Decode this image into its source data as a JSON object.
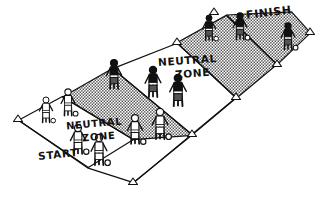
{
  "diagram": {
    "style": "hand-drawn line art, halftone shading",
    "background_color": "#ffffff",
    "ink_color": "#111111",
    "zone_fill_color": "#b9b9b9"
  },
  "labels": {
    "finish": "FINISH",
    "neutral_zone_far_line1": "NEUTRAL",
    "neutral_zone_far_line2": "ZONE",
    "neutral_zone_near_line1": "NEUTRAL",
    "neutral_zone_near_line2": "ZONE",
    "start": "START"
  },
  "zones": [
    {
      "name": "start-zone",
      "label": "START",
      "shaded": false,
      "polygon": "18,120 62,97 133,140 88,168"
    },
    {
      "name": "neutral-zone-near",
      "label": "NEUTRAL ZONE",
      "shaded": true,
      "polygon": "62,97 113,69 192,135 133,140"
    },
    {
      "name": "middle-open-zone",
      "label": "",
      "shaded": false,
      "polygon": "113,69 177,43 236,98 192,135"
    },
    {
      "name": "neutral-zone-far",
      "label": "NEUTRAL ZONE",
      "shaded": true,
      "polygon": "177,43 226,15 277,65 236,98"
    },
    {
      "name": "finish-zone",
      "label": "FINISH",
      "shaded": true,
      "polygon": "226,15 292,12 310,33 277,65"
    }
  ],
  "cone_markers": [
    {
      "name": "cone-start-left",
      "x": 18,
      "y": 120
    },
    {
      "name": "cone-start-bottom",
      "x": 133,
      "y": 183
    },
    {
      "name": "cone-near-nz-right",
      "x": 192,
      "y": 135
    },
    {
      "name": "cone-mid-right",
      "x": 236,
      "y": 98
    },
    {
      "name": "cone-far-nz-right",
      "x": 277,
      "y": 65
    },
    {
      "name": "cone-far-nz-left",
      "x": 177,
      "y": 43
    },
    {
      "name": "cone-finish-top",
      "x": 214,
      "y": 13
    },
    {
      "name": "cone-finish-right",
      "x": 310,
      "y": 33
    }
  ],
  "players": [
    {
      "name": "player-finish-1",
      "shirt": "dark",
      "x": 209,
      "y": 18,
      "scale": 1.0,
      "ball": true
    },
    {
      "name": "player-finish-2",
      "shirt": "dark",
      "x": 240,
      "y": 16,
      "scale": 1.05,
      "ball": true
    },
    {
      "name": "player-finish-3",
      "shirt": "dark",
      "x": 288,
      "y": 26,
      "scale": 1.05,
      "ball": true
    },
    {
      "name": "player-nz-far-1",
      "shirt": "dark",
      "x": 114,
      "y": 63,
      "scale": 1.15,
      "ball": false
    },
    {
      "name": "player-nz-far-2",
      "shirt": "dark",
      "x": 153,
      "y": 70,
      "scale": 1.2,
      "ball": false
    },
    {
      "name": "player-nz-far-3",
      "shirt": "dark",
      "x": 178,
      "y": 78,
      "scale": 1.25,
      "ball": false
    },
    {
      "name": "player-open-1",
      "shirt": "light",
      "x": 135,
      "y": 118,
      "scale": 1.15,
      "ball": true
    },
    {
      "name": "player-open-2",
      "shirt": "light",
      "x": 160,
      "y": 112,
      "scale": 1.2,
      "ball": true
    },
    {
      "name": "player-start-1",
      "shirt": "light",
      "x": 46,
      "y": 100,
      "scale": 1.0,
      "ball": true
    },
    {
      "name": "player-start-2",
      "shirt": "light",
      "x": 68,
      "y": 92,
      "scale": 1.05,
      "ball": true
    },
    {
      "name": "player-start-3",
      "shirt": "light",
      "x": 78,
      "y": 128,
      "scale": 1.15,
      "ball": true
    },
    {
      "name": "player-start-4",
      "shirt": "light",
      "x": 99,
      "y": 138,
      "scale": 1.2,
      "ball": true
    }
  ]
}
